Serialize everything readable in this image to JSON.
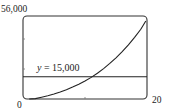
{
  "chart_data": {
    "type": "line",
    "title": "",
    "xlabel": "",
    "ylabel": "",
    "xlim": [
      0,
      20
    ],
    "ylim": [
      0,
      56000
    ],
    "x_tick_labels": [
      "0",
      "20"
    ],
    "y_tick_labels": [
      "56,000"
    ],
    "grid": false,
    "legend": null,
    "series": [
      {
        "name": "curve",
        "x": [
          1,
          2,
          3,
          4,
          5,
          6,
          7,
          8,
          9,
          10,
          11,
          12,
          13,
          14,
          15,
          16,
          17,
          18,
          19,
          19.8
        ],
        "values": [
          0,
          300,
          1200,
          2200,
          3400,
          4700,
          6200,
          8000,
          10000,
          12200,
          14600,
          17400,
          20500,
          24000,
          27800,
          32000,
          36600,
          41600,
          47000,
          52600
        ]
      },
      {
        "name": "y = 15,000",
        "x": [
          0,
          20
        ],
        "values": [
          15000,
          15000
        ]
      }
    ],
    "annotations": [
      {
        "text": "y = 15,000",
        "x": 2.2,
        "y": 17500
      }
    ]
  },
  "labels": {
    "ymax": "56,000",
    "xmin": "0",
    "xmax": "20",
    "ref_var": "y",
    "ref_rest": " = 15,000"
  }
}
